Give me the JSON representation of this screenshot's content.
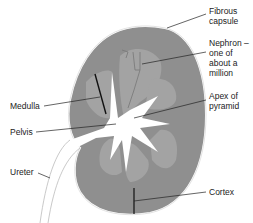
{
  "diagram": {
    "colors": {
      "cortex": "#8f8f8f",
      "medulla_pyramid": "#a3a3a3",
      "pelvis": "#ffffff",
      "capsule": "#ffffff",
      "outline": "#c8c8c8",
      "leader_line": "#222222"
    },
    "labels": {
      "fibrous_capsule": "Fibrous\ncapsule",
      "nephron": "Nephron –\none of\nabout a\nmillion",
      "medulla": "Medulla",
      "apex_of_pyramid": "Apex of\npyramid",
      "pelvis": "Pelvis",
      "ureter": "Ureter",
      "cortex": "Cortex"
    }
  }
}
